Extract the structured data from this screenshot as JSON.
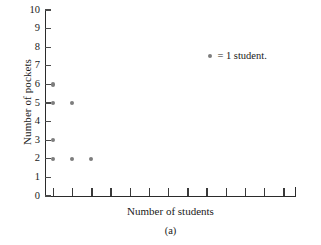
{
  "chart_data": {
    "type": "scatter",
    "title": "",
    "xlabel": "Number of students",
    "ylabel": "Number of pockets",
    "caption": "(a)",
    "grid": false,
    "legend_position": "inside-top-right",
    "legend": [
      {
        "marker": "dot",
        "text": "= 1 student."
      }
    ],
    "ylim": [
      0,
      10
    ],
    "ytick_labels": [
      "0",
      "1",
      "2",
      "3",
      "4",
      "5",
      "6",
      "7",
      "8",
      "9",
      "10"
    ],
    "ytick_values": [
      0,
      1,
      2,
      3,
      4,
      5,
      6,
      7,
      8,
      9,
      10
    ],
    "xlim": [
      0,
      13
    ],
    "xtick_labels": [
      "",
      "",
      "",
      "",
      "",
      "",
      "",
      "",
      "",
      "",
      "",
      "",
      ""
    ],
    "xtick_count": 13,
    "marker_color": "#7d7d7d",
    "axis_color": "#2b2b2b",
    "points": [
      {
        "x": 1,
        "y": 6
      },
      {
        "x": 1,
        "y": 5
      },
      {
        "x": 1,
        "y": 3
      },
      {
        "x": 1,
        "y": 2
      },
      {
        "x": 2,
        "y": 5
      },
      {
        "x": 2,
        "y": 2
      },
      {
        "x": 3,
        "y": 2
      }
    ],
    "columns": [
      {
        "student_column": 1,
        "pockets": [
          2,
          3,
          5,
          6
        ]
      },
      {
        "student_column": 2,
        "pockets": [
          2,
          5
        ]
      },
      {
        "student_column": 3,
        "pockets": [
          2
        ]
      }
    ]
  },
  "colors": {
    "background": "#ffffff",
    "marker": "#7d7d7d",
    "axis": "#2b2b2b",
    "tick": "#4a4a4a",
    "text": "#1a1a1a"
  }
}
